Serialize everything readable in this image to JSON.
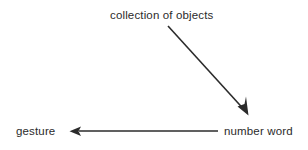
{
  "diagram": {
    "background_color": "#ffffff",
    "stroke_color": "#2b2b2b",
    "text_color": "#2b2b2b",
    "width": 308,
    "height": 150,
    "nodes": [
      {
        "id": "collection-of-objects",
        "label": "collection of objects",
        "x": 110,
        "y": 9
      },
      {
        "id": "gesture",
        "label": "gesture",
        "x": 16,
        "y": 125
      },
      {
        "id": "number-word",
        "label": "number word",
        "x": 224,
        "y": 125
      }
    ],
    "edges": [
      {
        "id": "collection-to-number-word",
        "from": "collection-of-objects",
        "to": "number-word",
        "direction": "down-right",
        "x1": 168,
        "y1": 26,
        "x2": 248,
        "y2": 114,
        "arrowhead": "end"
      },
      {
        "id": "number-word-to-gesture",
        "from": "number-word",
        "to": "gesture",
        "direction": "left",
        "x1": 218,
        "y1": 131,
        "x2": 70,
        "y2": 131,
        "arrowhead": "end"
      }
    ]
  }
}
